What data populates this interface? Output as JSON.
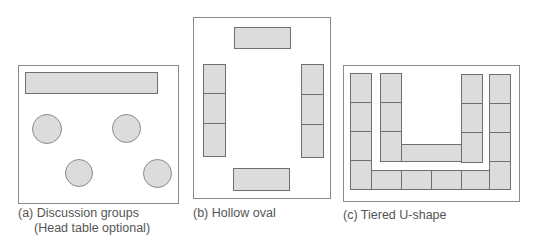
{
  "diagrams": [
    {
      "id": "a",
      "caption_line1": "(a) Discussion groups",
      "caption_line2": "(Head table optional)"
    },
    {
      "id": "b",
      "caption_line1": "(b) Hollow oval"
    },
    {
      "id": "c",
      "caption_line1": "(c) Tiered U-shape"
    }
  ],
  "colors": {
    "table_fill": "#dcdcdc",
    "table_border": "#6f6f6f",
    "frame_border": "#8a8a8a"
  }
}
